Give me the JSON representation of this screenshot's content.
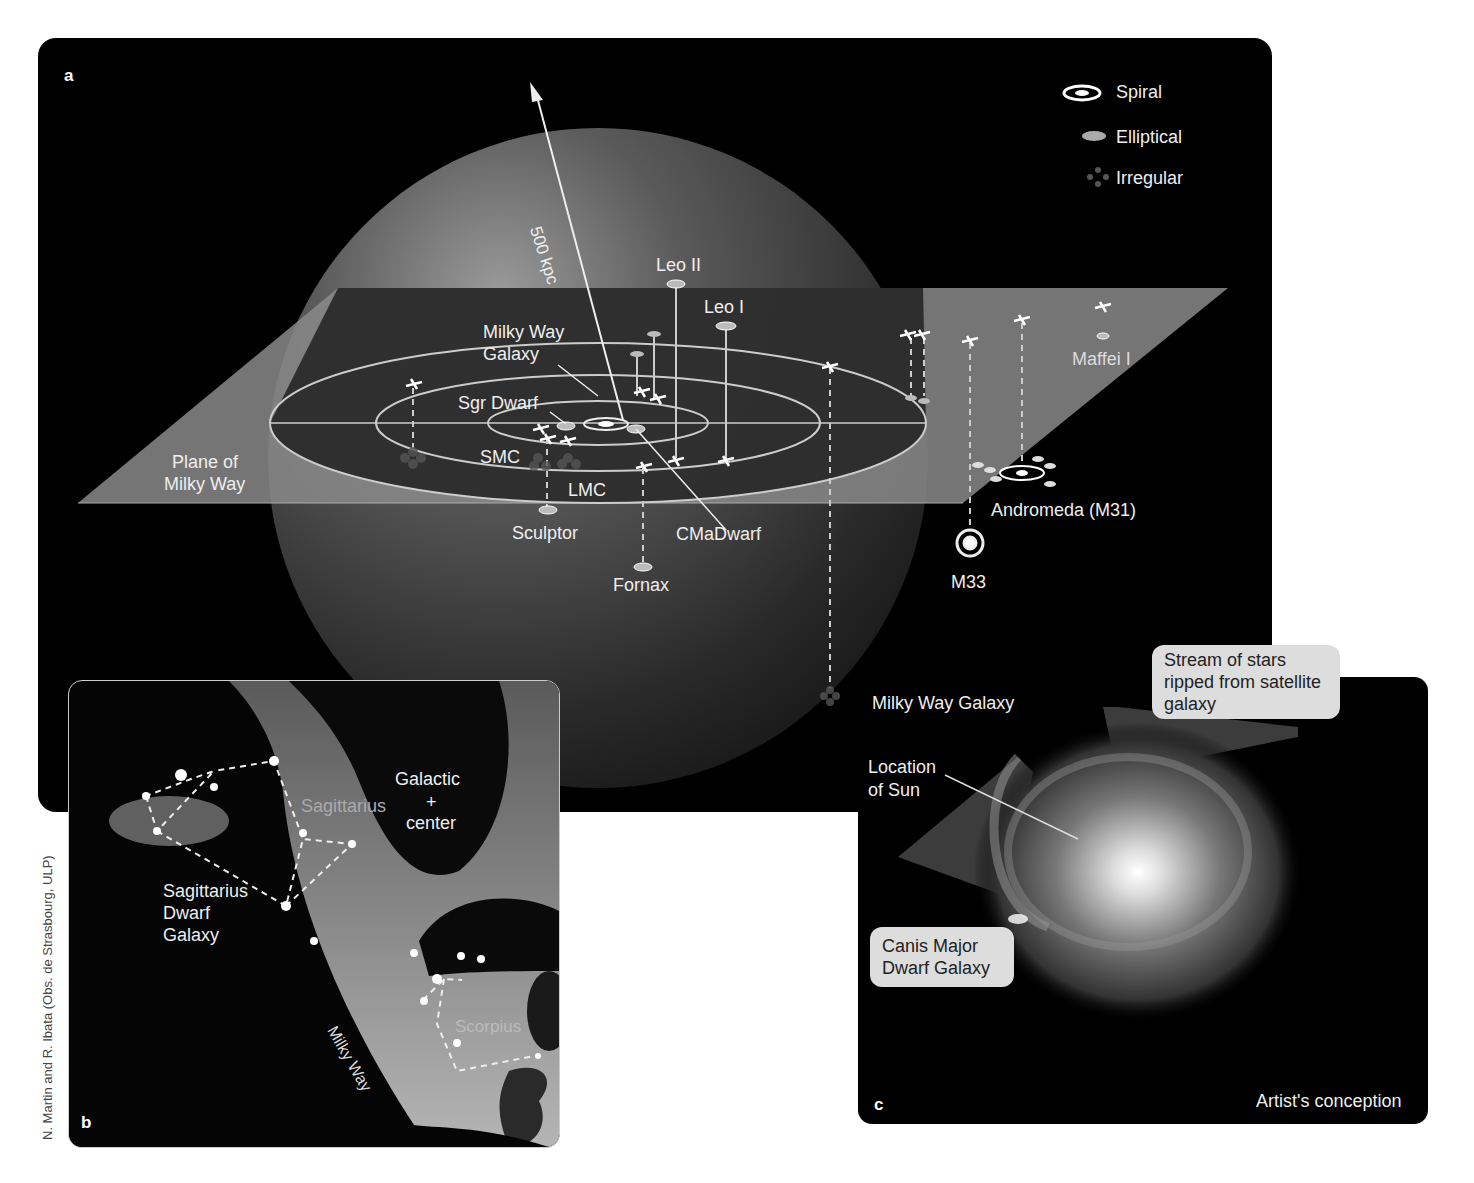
{
  "panel_a": {
    "letter": "a",
    "radius_label": "500 kpc",
    "plane_label_1": "Plane of",
    "plane_label_2": "Milky Way",
    "legend": {
      "spiral": "Spiral",
      "elliptical": "Elliptical",
      "irregular": "Irregular"
    },
    "galaxies": {
      "leo2": "Leo II",
      "leo1": "Leo I",
      "milky_way_1": "Milky Way",
      "milky_way_2": "Galaxy",
      "sgr_dwarf": "Sgr Dwarf",
      "smc": "SMC",
      "lmc": "LMC",
      "sculptor": "Sculptor",
      "cma_dwarf": "CMaDwarf",
      "fornax": "Fornax",
      "maffei": "Maffei I",
      "andromeda": "Andromeda (M31)",
      "m33": "M33"
    }
  },
  "panel_b": {
    "letter": "b",
    "sagittarius": "Sagittarius",
    "galactic_1": "Galactic",
    "galactic_plus": "+",
    "galactic_2": "center",
    "sgr_dwarf_1": "Sagittarius",
    "sgr_dwarf_2": "Dwarf",
    "sgr_dwarf_3": "Galaxy",
    "milky_way": "Milky Way",
    "scorpius": "Scorpius"
  },
  "panel_c": {
    "letter": "c",
    "title": "Milky Way Galaxy",
    "stream_1": "Stream of stars",
    "stream_2": "ripped from satellite",
    "stream_3": "galaxy",
    "sun_1": "Location",
    "sun_2": "of Sun",
    "cma_1": "Canis Major",
    "cma_2": "Dwarf Galaxy",
    "caption": "Artist's conception"
  },
  "credit": "N. Martin and R. Ibata (Obs. de Strasbourg, ULP)"
}
